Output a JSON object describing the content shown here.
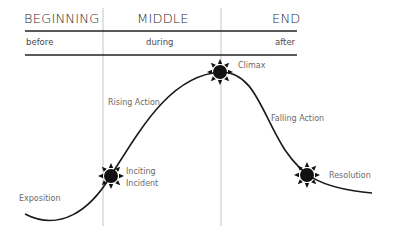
{
  "header": {
    "sections": [
      {
        "title": "BEGINNING",
        "sub": "before"
      },
      {
        "title": "MIDDLE",
        "sub": "during"
      },
      {
        "title": "END",
        "sub": "after"
      }
    ]
  },
  "curve": {
    "labels": {
      "exposition": "Exposition",
      "inciting_line1": "Inciting",
      "inciting_line2": "Incident",
      "rising": "Rising Action",
      "climax": "Climax",
      "falling": "Falling Action",
      "resolution": "Resolution"
    },
    "markers": [
      "sun-icon",
      "sun-icon",
      "sun-icon"
    ]
  },
  "colors": {
    "line": "#1a1a1a",
    "label": "#6a6a6a",
    "divider": "#c8c8c8"
  }
}
